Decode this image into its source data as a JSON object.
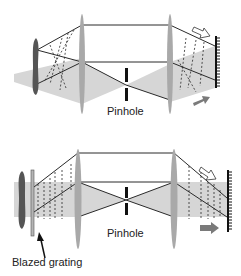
{
  "figure": {
    "panels": [
      {
        "id": "top",
        "label_pinhole": "Pinhole",
        "elements": [
          "object",
          "lens-1",
          "pinhole",
          "lens-2",
          "reflective-grating",
          "incident-arrow",
          "output-arrow"
        ]
      },
      {
        "id": "bottom",
        "label_pinhole": "Pinhole",
        "label_grating": "Blazed grating",
        "elements": [
          "object",
          "blazed-grating",
          "lens-1",
          "pinhole",
          "lens-2",
          "reflective-grating",
          "incident-arrow",
          "output-arrow"
        ]
      }
    ],
    "colors": {
      "beam_fill": "#d4d4d4",
      "lens_fill": "#a9a9a9",
      "object_fill": "#555555",
      "line": "#2a2a2a",
      "arrow_fill": "#7a7a7a"
    }
  }
}
